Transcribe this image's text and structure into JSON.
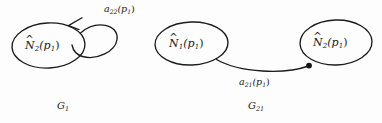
{
  "figure": {
    "background_color": "#fdfdfd",
    "ink_color": "#1b1b1b",
    "graphs": [
      {
        "id": "G1",
        "caption": "G",
        "caption_subscript": "1",
        "nodes": [
          {
            "id": "n2",
            "base": "N",
            "accent": "^",
            "subscript": "2",
            "argument": "(p",
            "arg_subscript": "1",
            "arg_close": ")"
          }
        ],
        "edges": [
          {
            "id": "a22",
            "kind": "self-loop",
            "terminator": "arrowhead",
            "base": "a",
            "subscript": "22",
            "argument": "(p",
            "arg_subscript": "1",
            "arg_close": ")"
          }
        ]
      },
      {
        "id": "G21",
        "caption": "G",
        "caption_subscript": "21",
        "nodes": [
          {
            "id": "n1",
            "base": "N",
            "accent": "^",
            "subscript": "1",
            "argument": "(p",
            "arg_subscript": "1",
            "arg_close": ")"
          },
          {
            "id": "n2",
            "base": "N",
            "accent": "^",
            "subscript": "2",
            "argument": "(p",
            "arg_subscript": "1",
            "arg_close": ")"
          }
        ],
        "edges": [
          {
            "id": "a21",
            "kind": "curve",
            "terminator": "dot",
            "base": "a",
            "subscript": "21",
            "argument": "(p",
            "arg_subscript": "1",
            "arg_close": ")"
          }
        ]
      }
    ]
  }
}
